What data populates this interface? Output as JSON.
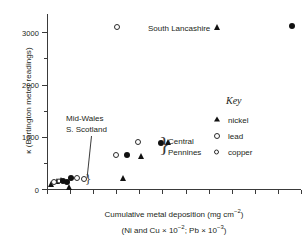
{
  "chart_data": {
    "type": "scatter",
    "title": "",
    "xlabel": "Cumulative metal deposition (mg cm−2)",
    "xlabel_line1": "Cumulative metal deposition (mg cm",
    "xlabel_line1_sup": "−2",
    "xlabel_line1_end": ")",
    "xlabel_line2_a": "(Ni and Cu × 10",
    "xlabel_line2_sup1": "−2",
    "xlabel_line2_b": "; Pb × 10",
    "xlabel_line2_sup2": "−3",
    "xlabel_line2_end": ")",
    "ylabel": "κ (Bartington meter readings)",
    "ylim": [
      0,
      3350
    ],
    "xlim": [
      0,
      11
    ],
    "grid": false,
    "y_ticks_major": [
      0,
      1000,
      2000,
      3000
    ],
    "y_ticks_minor": [
      500,
      1500,
      2500
    ],
    "y_tick_labels": [
      "0",
      "1000",
      "2000",
      "3000"
    ],
    "x_ticks": [
      0,
      1,
      2,
      3,
      4,
      5,
      6,
      7,
      8,
      9,
      10,
      11
    ],
    "x_tick_labels": [],
    "legend_position": "right",
    "series": [
      {
        "name": "nickel",
        "marker": "filled-triangle",
        "points": [
          {
            "x": 0.18,
            "y": 90
          },
          {
            "x": 0.42,
            "y": 150
          },
          {
            "x": 0.62,
            "y": 170
          },
          {
            "x": 0.95,
            "y": 30
          },
          {
            "x": 3.3,
            "y": 215
          },
          {
            "x": 4.05,
            "y": 640
          },
          {
            "x": 5.22,
            "y": 900
          },
          {
            "x": 7.35,
            "y": 3110
          }
        ]
      },
      {
        "name": "lead",
        "marker": "open-circle-lead",
        "points": [
          {
            "x": 0.3,
            "y": 130
          },
          {
            "x": 1.3,
            "y": 205
          },
          {
            "x": 1.62,
            "y": 200
          },
          {
            "x": 2.98,
            "y": 660
          },
          {
            "x": 3.95,
            "y": 895
          },
          {
            "x": 3.05,
            "y": 3110
          }
        ]
      },
      {
        "name": "copper",
        "marker": "open-circle-copper",
        "points": [
          {
            "x": 0.52,
            "y": 150
          }
        ]
      },
      {
        "name": "filled-circle-series",
        "marker": "filled-circle",
        "points": [
          {
            "x": 0.7,
            "y": 150
          },
          {
            "x": 0.88,
            "y": 140
          },
          {
            "x": 1.05,
            "y": 215
          },
          {
            "x": 3.45,
            "y": 645
          },
          {
            "x": 4.92,
            "y": 890
          },
          {
            "x": 10.6,
            "y": 3120
          }
        ]
      }
    ],
    "annotations": [
      {
        "name": "south-lancashire",
        "text": "South Lancashire",
        "x": 7.35,
        "y": 2900
      },
      {
        "name": "mid-wales",
        "text_line1": "Mid-Wales",
        "text_line2": "S. Scotland",
        "x": 1.9,
        "y": 1320
      },
      {
        "name": "central-pennines",
        "text_line1": "Central",
        "text_line2": "Pennines",
        "x": 5.9,
        "y": 900
      }
    ]
  },
  "axis": {
    "y_labels": [
      "3000",
      "2000",
      "1000",
      "0"
    ],
    "x_title_line1_pre": "Cumulative metal deposition (mg cm",
    "x_title_line1_sup": "−2",
    "x_title_line1_post": ")",
    "x_title_line2_pre": "(Ni and Cu × 10",
    "x_title_line2_sup1": "−2",
    "x_title_line2_mid": "; Pb × 10",
    "x_title_line2_sup2": "−3",
    "x_title_line2_post": ")",
    "y_title": "κ (Bartington meter readings)"
  },
  "annotations": {
    "south_lancashire": "South Lancashire",
    "mid_wales_line1": "Mid-Wales",
    "mid_wales_line2": "S. Scotland",
    "central_pennines_line1": "Central",
    "central_pennines_line2": "Pennines",
    "brace_central": "}",
    "brace_mid_wales": "}"
  },
  "key": {
    "title": "Key",
    "items": [
      {
        "label": "nickel",
        "marker": "filled-triangle"
      },
      {
        "label": "lead",
        "marker": "open-circle-lead"
      },
      {
        "label": "copper",
        "marker": "open-circle-copper"
      }
    ]
  },
  "colors": {
    "marker_fill": "#111111",
    "marker_stroke": "#2b2b2b",
    "axis": "#3a3a3a",
    "text": "#231f20",
    "background": "#ffffff"
  }
}
